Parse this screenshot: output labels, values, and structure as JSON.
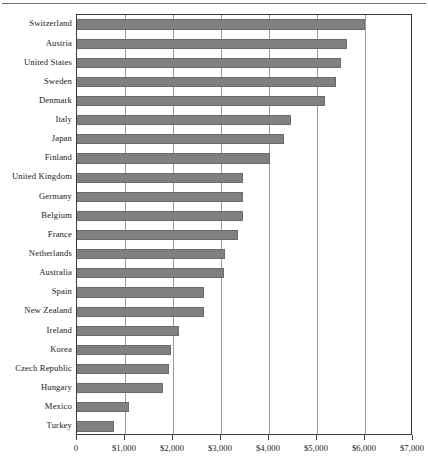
{
  "chart_data": {
    "type": "bar",
    "orientation": "horizontal",
    "title": "",
    "subtitle": "",
    "xlabel": "",
    "ylabel": "",
    "xlim": [
      0,
      7000
    ],
    "ylim": null,
    "grid": true,
    "legend": null,
    "legend_position": "none",
    "tick_prefix": "$",
    "categories": [
      "Switzerland",
      "Austria",
      "United States",
      "Sweden",
      "Denmark",
      "Italy",
      "Japan",
      "Finland",
      "United Kingdom",
      "Germany",
      "Belgium",
      "France",
      "Netherlands",
      "Australia",
      "Spain",
      "New Zealand",
      "Ireland",
      "Korea",
      "Czech Republic",
      "Hungary",
      "Mexico",
      "Turkey"
    ],
    "values": [
      6000,
      5620,
      5500,
      5400,
      5170,
      4460,
      4310,
      4030,
      3460,
      3460,
      3460,
      3360,
      3080,
      3060,
      2640,
      2640,
      2120,
      1960,
      1910,
      1800,
      1080,
      770
    ],
    "xticks": [
      0,
      1000,
      2000,
      3000,
      4000,
      5000,
      6000,
      7000
    ],
    "xticklabels": [
      "0",
      "$1,000",
      "$2,000",
      "$3,000",
      "$4,000",
      "$5,000",
      "$6,000",
      "$7,000"
    ],
    "gridline_values": [
      1000,
      2000,
      3000,
      4000,
      5000,
      6000
    ],
    "bar_color": "#808080",
    "bar_edge_color": "#6a6a6a",
    "axis_color": "#3c3c3c",
    "grid_color": "#9a9a9a",
    "rule_color": "#6f6f6f",
    "background_color": "#ffffff"
  }
}
